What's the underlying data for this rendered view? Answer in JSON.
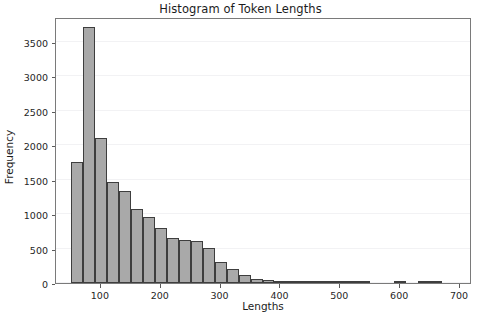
{
  "chart_data": {
    "type": "bar",
    "title": "Histogram of Token Lengths",
    "xlabel": "Lengths",
    "ylabel": "Frequency",
    "xlim": [
      25,
      720
    ],
    "ylim": [
      0,
      3860
    ],
    "grid": true,
    "legend_position": "none",
    "bin_width": 20,
    "bar_color": "#a9a9a9",
    "bar_edge_color": "#3e3e3e",
    "xticks": [
      100,
      200,
      300,
      400,
      500,
      600,
      700
    ],
    "xtick_labels": [
      "100",
      "200",
      "300",
      "400",
      "500",
      "600",
      "700"
    ],
    "yticks": [
      0,
      500,
      1000,
      1500,
      2000,
      2500,
      3000,
      3500
    ],
    "ytick_labels": [
      "0",
      "500",
      "1000",
      "1500",
      "2000",
      "2500",
      "3000",
      "3500"
    ],
    "bins": [
      {
        "x0": 50,
        "x1": 70,
        "value": 1750
      },
      {
        "x0": 70,
        "x1": 90,
        "value": 3710
      },
      {
        "x0": 90,
        "x1": 110,
        "value": 2110
      },
      {
        "x0": 110,
        "x1": 130,
        "value": 1460
      },
      {
        "x0": 130,
        "x1": 150,
        "value": 1330
      },
      {
        "x0": 150,
        "x1": 170,
        "value": 1075
      },
      {
        "x0": 170,
        "x1": 190,
        "value": 960
      },
      {
        "x0": 190,
        "x1": 210,
        "value": 800
      },
      {
        "x0": 210,
        "x1": 230,
        "value": 655
      },
      {
        "x0": 230,
        "x1": 250,
        "value": 620
      },
      {
        "x0": 250,
        "x1": 270,
        "value": 605
      },
      {
        "x0": 270,
        "x1": 290,
        "value": 505
      },
      {
        "x0": 290,
        "x1": 310,
        "value": 300
      },
      {
        "x0": 310,
        "x1": 330,
        "value": 205
      },
      {
        "x0": 330,
        "x1": 350,
        "value": 120
      },
      {
        "x0": 350,
        "x1": 370,
        "value": 55
      },
      {
        "x0": 370,
        "x1": 390,
        "value": 40
      },
      {
        "x0": 390,
        "x1": 410,
        "value": 20
      },
      {
        "x0": 410,
        "x1": 430,
        "value": 12
      },
      {
        "x0": 430,
        "x1": 450,
        "value": 8
      },
      {
        "x0": 450,
        "x1": 470,
        "value": 6
      },
      {
        "x0": 470,
        "x1": 490,
        "value": 5
      },
      {
        "x0": 490,
        "x1": 510,
        "value": 4
      },
      {
        "x0": 510,
        "x1": 530,
        "value": 3
      },
      {
        "x0": 530,
        "x1": 550,
        "value": 2
      },
      {
        "x0": 590,
        "x1": 610,
        "value": 10
      },
      {
        "x0": 630,
        "x1": 650,
        "value": 4
      },
      {
        "x0": 650,
        "x1": 670,
        "value": 12
      }
    ]
  }
}
